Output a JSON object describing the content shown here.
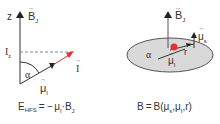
{
  "left_panel": {
    "axis_label": "z",
    "field_label": "B",
    "field_sub": "J",
    "projection_label": "I",
    "projection_sub": "z",
    "angle_label": "α",
    "moment_label": "μ",
    "moment_sub": "I",
    "spin_label": "I",
    "formula": {
      "lhs": "E",
      "lhs_sub": "HFS",
      "eq": "= −",
      "mu": "μ",
      "mu_sub": "I",
      "dot": "·",
      "b": "B",
      "b_sub": "J"
    }
  },
  "right_panel": {
    "field_label": "B",
    "field_sub": "J",
    "spin_moment_label": "μ",
    "spin_moment_sub": "s",
    "angle_label": "α",
    "radius_label": "r",
    "nuclear_moment_label": "μ",
    "nuclear_moment_sub": "I",
    "formula": {
      "lhs": "B",
      "eq": "=",
      "rhs": "B(",
      "mu1": "μ",
      "mu1_sub": "s",
      "comma1": ",",
      "mu2": "μ",
      "mu2_sub": "I",
      "tail": ",r)"
    }
  },
  "colors": {
    "axis": "#333333",
    "spin_arrow": "#e03030",
    "dashed": "#888888",
    "ellipse_fill": "#d9d9d9",
    "ellipse_stroke": "#555555"
  }
}
